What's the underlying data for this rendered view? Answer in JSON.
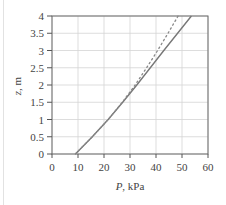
{
  "chart_data": {
    "type": "line",
    "title": "",
    "xlabel": "P, kPa",
    "ylabel": "z, m",
    "xlim": [
      0,
      60
    ],
    "ylim": [
      0,
      4
    ],
    "grid": true,
    "legend": null,
    "x_ticks": [
      "0",
      "10",
      "20",
      "30",
      "40",
      "50",
      "60"
    ],
    "y_ticks": [
      "0",
      "0.5",
      "1",
      "1.5",
      "2",
      "2.5",
      "3",
      "3.5",
      "4"
    ],
    "series": [
      {
        "name": "solid",
        "style": "solid",
        "color": "#777777",
        "points": [
          [
            9,
            0
          ],
          [
            15.5,
            0.5
          ],
          [
            21.6,
            1.0
          ],
          [
            27.2,
            1.5
          ],
          [
            32.6,
            2.0
          ],
          [
            37.8,
            2.5
          ],
          [
            43.0,
            3.0
          ],
          [
            48.3,
            3.5
          ],
          [
            53.6,
            4.0
          ]
        ]
      },
      {
        "name": "dashed",
        "style": "dotted",
        "color": "#888888",
        "points": [
          [
            9,
            0
          ],
          [
            15.5,
            0.5
          ],
          [
            21.6,
            1.0
          ],
          [
            27.0,
            1.5
          ],
          [
            32.0,
            2.0
          ],
          [
            36.4,
            2.5
          ],
          [
            40.6,
            3.0
          ],
          [
            44.6,
            3.5
          ],
          [
            48.5,
            4.0
          ]
        ]
      }
    ]
  }
}
